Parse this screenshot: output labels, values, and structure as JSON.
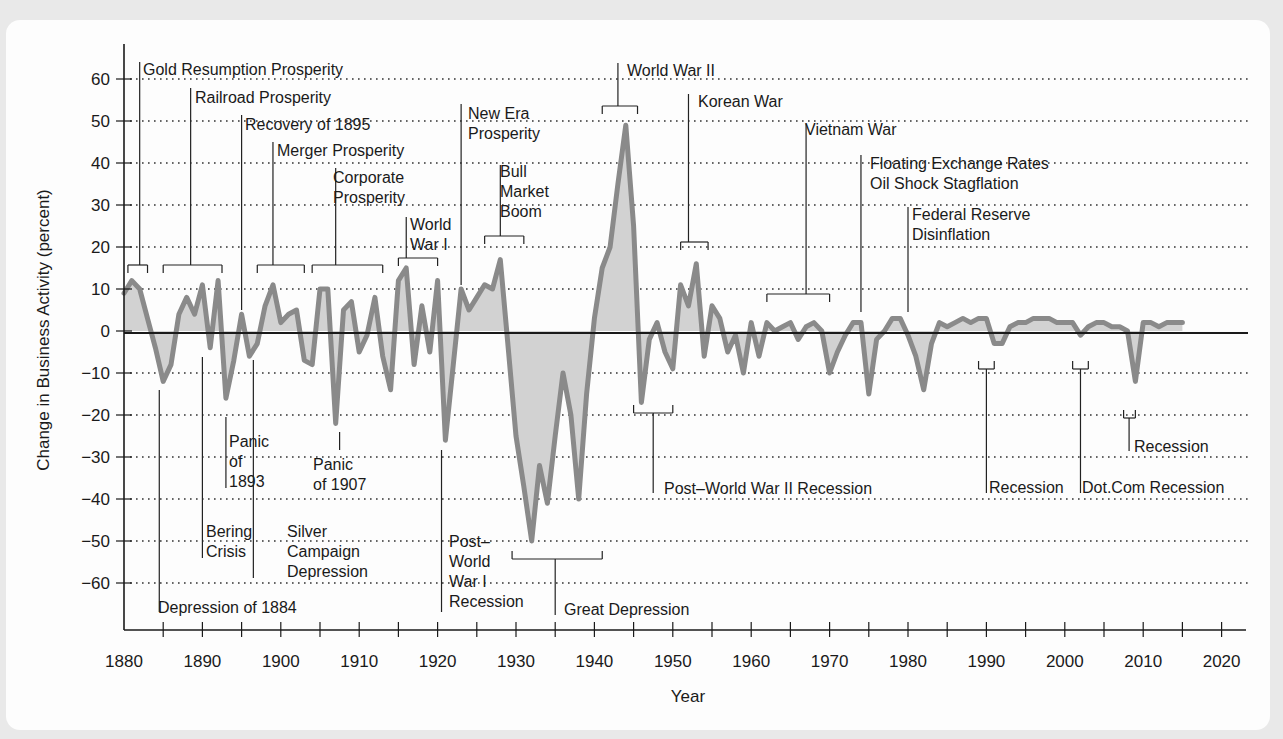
{
  "chart_data": {
    "type": "area",
    "title": "",
    "xlabel": "Year",
    "ylabel": "Change in Business Activity (percent)",
    "xlim": [
      1880,
      2023
    ],
    "ylim": [
      -68,
      68
    ],
    "x_ticks": [
      1880,
      1890,
      1900,
      1910,
      1920,
      1930,
      1940,
      1950,
      1960,
      1970,
      1980,
      1990,
      2000,
      2010,
      2020
    ],
    "x_minor_tick_step": 5,
    "y_ticks": [
      60,
      50,
      40,
      30,
      20,
      10,
      0,
      -10,
      -20,
      -30,
      -40,
      -50,
      -60
    ],
    "grid": "horizontal dotted",
    "colors": {
      "line": "#8a8a8a",
      "fill": "#d2d2d2",
      "axis": "#1a1a1a",
      "grid": "#333333"
    },
    "series": [
      {
        "name": "Change in Business Activity",
        "x": [
          1880,
          1881,
          1882,
          1883,
          1884,
          1885,
          1886,
          1887,
          1888,
          1889,
          1890,
          1891,
          1892,
          1893,
          1894,
          1895,
          1896,
          1897,
          1898,
          1899,
          1900,
          1901,
          1902,
          1903,
          1904,
          1905,
          1906,
          1907,
          1908,
          1909,
          1910,
          1911,
          1912,
          1913,
          1914,
          1915,
          1916,
          1917,
          1918,
          1919,
          1920,
          1921,
          1922,
          1923,
          1924,
          1925,
          1926,
          1927,
          1928,
          1929,
          1930,
          1931,
          1932,
          1933,
          1934,
          1935,
          1936,
          1937,
          1938,
          1939,
          1940,
          1941,
          1942,
          1943,
          1944,
          1945,
          1946,
          1947,
          1948,
          1949,
          1950,
          1951,
          1952,
          1953,
          1954,
          1955,
          1956,
          1957,
          1958,
          1959,
          1960,
          1961,
          1962,
          1963,
          1964,
          1965,
          1966,
          1967,
          1968,
          1969,
          1970,
          1971,
          1972,
          1973,
          1974,
          1975,
          1976,
          1977,
          1978,
          1979,
          1980,
          1981,
          1982,
          1983,
          1984,
          1985,
          1986,
          1987,
          1988,
          1989,
          1990,
          1991,
          1992,
          1993,
          1994,
          1995,
          1996,
          1997,
          1998,
          1999,
          2000,
          2001,
          2002,
          2003,
          2004,
          2005,
          2006,
          2007,
          2008,
          2009,
          2010,
          2011,
          2012,
          2013,
          2014,
          2015
        ],
        "values": [
          9,
          12,
          10,
          3,
          -4,
          -12,
          -8,
          4,
          8,
          4,
          11,
          -4,
          12,
          -16,
          -7,
          4,
          -6,
          -3,
          6,
          11,
          2,
          4,
          5,
          -7,
          -8,
          10,
          10,
          -22,
          5,
          7,
          -5,
          -1,
          8,
          -6,
          -14,
          12,
          15,
          -8,
          6,
          -5,
          12,
          -26,
          -8,
          10,
          5,
          8,
          11,
          10,
          17,
          -4,
          -25,
          -37,
          -50,
          -32,
          -41,
          -25,
          -10,
          -20,
          -40,
          -15,
          3,
          15,
          20,
          35,
          49,
          25,
          -17,
          -2,
          2,
          -5,
          -9,
          11,
          6,
          16,
          -6,
          6,
          3,
          -5,
          -1,
          -10,
          2,
          -6,
          2,
          0,
          1,
          2,
          -2,
          1,
          2,
          0,
          -10,
          -5,
          -1,
          2,
          2,
          -15,
          -2,
          0,
          3,
          3,
          -1,
          -6,
          -14,
          -3,
          2,
          1,
          2,
          3,
          2,
          3,
          3,
          -3,
          -3,
          1,
          2,
          2,
          3,
          3,
          3,
          2,
          2,
          2,
          -1,
          1,
          2,
          2,
          1,
          1,
          0,
          -12,
          2,
          2,
          1,
          2,
          2,
          2
        ]
      }
    ],
    "annotations": [
      {
        "text": "Gold Resumption Prosperity",
        "range": [
          1880.5,
          1883
        ],
        "side": "above"
      },
      {
        "text": "Railroad Prosperity",
        "range": [
          1885,
          1892.5
        ],
        "side": "above"
      },
      {
        "text": "Recovery of 1895",
        "point": 1895,
        "side": "above"
      },
      {
        "text": "Merger Prosperity",
        "range": [
          1897,
          1903
        ],
        "side": "above"
      },
      {
        "text": "Corporate Prosperity",
        "range": [
          1904,
          1913
        ],
        "side": "above"
      },
      {
        "text": "World War I",
        "range": [
          1915,
          1920
        ],
        "side": "above"
      },
      {
        "text": "New Era Prosperity",
        "point": 1923,
        "side": "above"
      },
      {
        "text": "Bull Market Boom",
        "range": [
          1926,
          1931
        ],
        "side": "above"
      },
      {
        "text": "World War II",
        "range": [
          1941,
          1945.5
        ],
        "side": "above"
      },
      {
        "text": "Korean War",
        "range": [
          1951,
          1954.5
        ],
        "side": "above"
      },
      {
        "text": "Vietnam War",
        "range": [
          1962,
          1970
        ],
        "side": "above"
      },
      {
        "text": "Floating Exchange Rates Oil Shock Stagflation",
        "point": 1974,
        "side": "above"
      },
      {
        "text": "Federal Reserve Disinflation",
        "point": 1980,
        "side": "above"
      },
      {
        "text": "Depression of 1884",
        "point": 1884.5,
        "side": "below"
      },
      {
        "text": "Bering Crisis",
        "point": 1890,
        "side": "below"
      },
      {
        "text": "Panic of 1893",
        "point": 1893,
        "side": "below"
      },
      {
        "text": "Silver Campaign Depression",
        "point": 1896.5,
        "side": "below"
      },
      {
        "text": "Panic of 1907",
        "point": 1907.5,
        "side": "below"
      },
      {
        "text": "Post-World War I Recession",
        "point": 1920.5,
        "side": "below"
      },
      {
        "text": "Great Depression",
        "range": [
          1929.5,
          1941
        ],
        "side": "below"
      },
      {
        "text": "Post-World War II Recession",
        "range": [
          1945,
          1950
        ],
        "side": "below"
      },
      {
        "text": "Recession",
        "range": [
          1989,
          1991
        ],
        "side": "below"
      },
      {
        "text": "Dot.Com Recession",
        "range": [
          2001,
          2003
        ],
        "side": "below"
      },
      {
        "text": "Recession",
        "range": [
          2007.5,
          2009
        ],
        "side": "below"
      }
    ],
    "legend": "none"
  },
  "axes": {
    "xlabel": "Year",
    "ylabel": "Change in Business Activity (percent)",
    "x_tick_labels": [
      "1880",
      "1890",
      "1900",
      "1910",
      "1920",
      "1930",
      "1940",
      "1950",
      "1960",
      "1970",
      "1980",
      "1990",
      "2000",
      "2010",
      "2020"
    ],
    "y_tick_labels": [
      "60",
      "50",
      "40",
      "30",
      "20",
      "10",
      "0",
      "−10",
      "−20",
      "−30",
      "−40",
      "−50",
      "−60"
    ]
  },
  "labels": {
    "gold": "Gold Resumption Prosperity",
    "railroad": "Railroad Prosperity",
    "recovery1895": "Recovery of 1895",
    "merger": "Merger Prosperity",
    "corporate": [
      "Corporate",
      "Prosperity"
    ],
    "ww1": [
      "World",
      "War I"
    ],
    "newera": [
      "New Era",
      "Prosperity"
    ],
    "bull": [
      "Bull",
      "Market",
      "Boom"
    ],
    "ww2": "World War II",
    "korean": "Korean War",
    "vietnam": "Vietnam War",
    "floating": [
      "Floating Exchange Rates",
      "Oil Shock Stagflation"
    ],
    "fed": [
      "Federal Reserve",
      "Disinflation"
    ],
    "dep1884": "Depression of 1884",
    "bering": [
      "Bering",
      "Crisis"
    ],
    "panic1893": [
      "Panic",
      "of",
      "1893"
    ],
    "silver": [
      "Silver",
      "Campaign",
      "Depression"
    ],
    "panic1907": [
      "Panic",
      "of 1907"
    ],
    "postww1": [
      "Post–",
      "World",
      "War I",
      "Recession"
    ],
    "great": "Great Depression",
    "postww2": "Post–World War II Recession",
    "rec1990": "Recession",
    "dotcom": "Dot.Com Recession",
    "rec2008": "Recession"
  }
}
